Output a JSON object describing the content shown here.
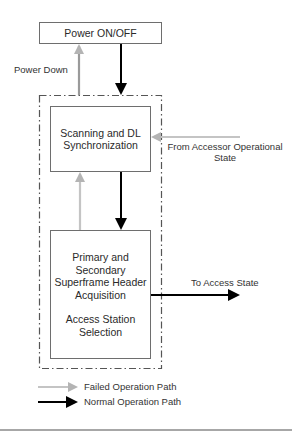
{
  "diagram": {
    "states": {
      "power": {
        "label": "Power ON/OFF"
      },
      "scanning": {
        "lines": [
          "Scanning and DL",
          "Synchronization"
        ]
      },
      "acquisition": {
        "lines": [
          "Primary and",
          "Secondary",
          "Superframe Header",
          "Acquisition"
        ],
        "lines2": [
          "Access Station",
          "Selection"
        ]
      }
    },
    "labels": {
      "power_down": "Power Down",
      "from_accessor": [
        "From Accessor Operational",
        "State"
      ],
      "to_access": "To Access State"
    },
    "legend": {
      "failed": "Failed Operation Path",
      "normal": "Normal Operation Path"
    },
    "colors": {
      "failed_path": "#b4b4b4",
      "normal_path": "#000000",
      "box_border": "#6e6e6e",
      "group_border": "#555555",
      "rule": "#8a8a8a"
    }
  }
}
